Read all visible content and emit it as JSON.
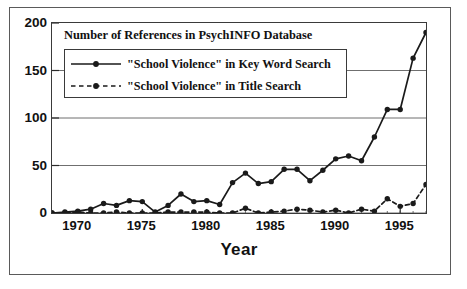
{
  "chart_data": {
    "type": "line",
    "title": "Number of References in PsychINFO Database",
    "xlabel": "Year",
    "ylabel": "",
    "xlim": [
      1968,
      1997
    ],
    "ylim": [
      0,
      200
    ],
    "grid": true,
    "legend_position": "top-left-inside",
    "x": [
      1968,
      1969,
      1970,
      1971,
      1972,
      1973,
      1974,
      1975,
      1976,
      1977,
      1978,
      1979,
      1980,
      1981,
      1982,
      1983,
      1984,
      1985,
      1986,
      1987,
      1988,
      1989,
      1990,
      1991,
      1992,
      1993,
      1994,
      1995,
      1996,
      1997
    ],
    "xticks": [
      1970,
      1975,
      1980,
      1985,
      1990,
      1995
    ],
    "yticks": [
      0,
      50,
      100,
      150,
      200
    ],
    "series": [
      {
        "name": "\"School Violence\" in Key Word Search",
        "style": "solid",
        "marker": "filled-circle",
        "color": "#1a1a1a",
        "values": [
          0,
          1,
          2,
          4,
          10,
          8,
          13,
          12,
          1,
          8,
          20,
          12,
          13,
          9,
          32,
          42,
          31,
          33,
          46,
          46,
          34,
          45,
          57,
          60,
          55,
          80,
          109,
          109,
          163,
          190
        ]
      },
      {
        "name": "\"School Violence\" in Title Search",
        "style": "dashed",
        "marker": "filled-circle",
        "color": "#1a1a1a",
        "values": [
          0,
          0,
          1,
          0,
          0,
          1,
          0,
          0,
          0,
          1,
          1,
          1,
          1,
          0,
          0,
          5,
          0,
          1,
          2,
          4,
          3,
          1,
          3,
          0,
          4,
          2,
          15,
          7,
          10,
          30
        ]
      }
    ]
  },
  "axis": {
    "y_tick_labels": [
      "200",
      "150",
      "100",
      "50",
      "0"
    ],
    "x_tick_labels": [
      "1970",
      "1975",
      "1980",
      "1985",
      "1990",
      "1995"
    ],
    "x_axis_title": "Year"
  },
  "legend": {
    "entries": [
      {
        "label": "\"School Violence\" in Key Word Search",
        "style": "solid"
      },
      {
        "label": "\"School Violence\" in Title Search",
        "style": "dashed"
      }
    ]
  },
  "colors": {
    "series": "#1a1a1a",
    "grid": "#6f6f6f",
    "frame": "#3a3a3a",
    "outer_frame": "#5a5a5a",
    "background": "#ffffff",
    "text": "#111111"
  }
}
